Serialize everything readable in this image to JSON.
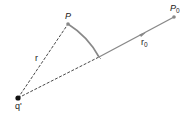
{
  "diagram": {
    "points": {
      "source_charge": {
        "label": "q'",
        "icon": "filled-dot",
        "color": "#111111"
      },
      "field_point": {
        "label": "P",
        "icon": "filled-dot",
        "color": "#888888"
      },
      "reference_point": {
        "label": "P",
        "subscript": "0",
        "icon": "filled-dot",
        "color": "#888888"
      }
    },
    "segments": {
      "distance_to_P": {
        "label": "r",
        "style": "dashed",
        "color": "#333333"
      },
      "distance_to_P0": {
        "label": "r",
        "subscript": "0",
        "style": "dashed-then-solid",
        "color": "#333333",
        "solid_color": "#888888"
      }
    },
    "arc": {
      "description": "circular arc of radius r centered at q' from P to the line q'P0",
      "color": "#888888"
    },
    "arrow": {
      "description": "arrowhead on segment toward P0",
      "color": "#888888"
    }
  }
}
